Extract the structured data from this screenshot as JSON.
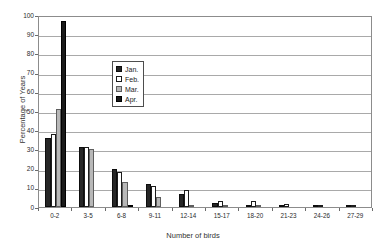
{
  "chart_data": {
    "type": "bar",
    "title": "",
    "xlabel": "Number of birds",
    "ylabel": "Percentage of Years",
    "categories": [
      "0-2",
      "3-5",
      "6-8",
      "9-11",
      "12-14",
      "15-17",
      "18-20",
      "21-23",
      "24-26",
      "27-29"
    ],
    "series": [
      {
        "name": "Jan.",
        "color": "#262626",
        "values": [
          36,
          31.5,
          20,
          12,
          7,
          2,
          1,
          1,
          0.5,
          0.5
        ]
      },
      {
        "name": "Feb.",
        "color": "#ffffff",
        "values": [
          38,
          31,
          18,
          11,
          9,
          3,
          3,
          1.5,
          1,
          1
        ]
      },
      {
        "name": "Mar.",
        "color": "#b8b8b8",
        "values": [
          51,
          30,
          13,
          5,
          1,
          1,
          0.5,
          0,
          0,
          0
        ]
      },
      {
        "name": "Apr.",
        "color": "#1a1a1a",
        "values": [
          97,
          0,
          1,
          0,
          0,
          0,
          0,
          0,
          0,
          0
        ]
      }
    ],
    "ylim": [
      0,
      100
    ],
    "ytick_step": 10,
    "yticks": [
      "0",
      "10",
      "20",
      "30",
      "40",
      "50",
      "60",
      "70",
      "80",
      "90",
      "100"
    ],
    "grid": "horizontal",
    "legend_position": "inside-upper-center"
  },
  "legend": {
    "items": [
      {
        "label": "Jan.",
        "swatch": "jan"
      },
      {
        "label": "Feb.",
        "swatch": "feb"
      },
      {
        "label": "Mar.",
        "swatch": "mar"
      },
      {
        "label": "Apr.",
        "swatch": "apr"
      }
    ]
  },
  "axes": {
    "y_title": "Percentage of Years",
    "x_title": "Number of birds"
  }
}
